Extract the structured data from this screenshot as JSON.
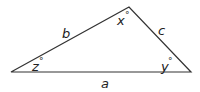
{
  "diagram": {
    "type": "triangle",
    "stroke_color": "#333333",
    "sides": {
      "a": "a",
      "b": "b",
      "c": "c"
    },
    "angles": {
      "x": "x",
      "y": "y",
      "z": "z"
    },
    "degree_symbol": "°"
  }
}
